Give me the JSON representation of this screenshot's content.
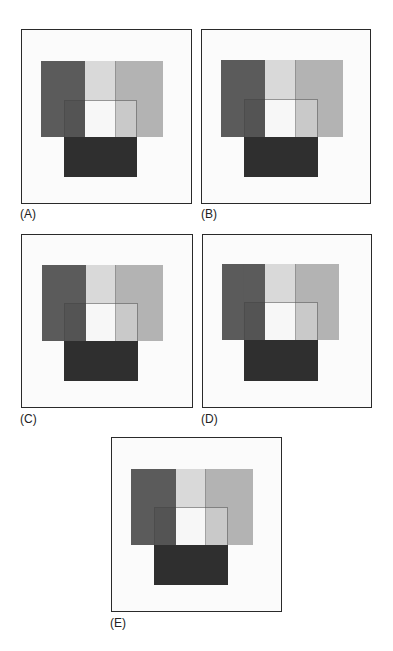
{
  "figure": {
    "colors": {
      "frame": "#2a2a2a",
      "frame_bg": "#fbfbfb",
      "dark_column": "#5b5b5b",
      "light_column": "#d9d9d9",
      "mid_column": "#b3b3b3",
      "inner_dark": "#545454",
      "inner_white": "#f7f7f7",
      "inner_right": "#c9c9c9",
      "bottom_block": "#2f2f2f"
    },
    "panels": [
      {
        "id": "A",
        "label": "(A)",
        "frame": {
          "x": 21,
          "y": 29,
          "w": 171,
          "h": 175
        },
        "label_pos": {
          "x": 20,
          "y": 208
        },
        "top": {
          "x": 41,
          "y": 61,
          "w": 122,
          "h": 76,
          "c1": 85,
          "c2": 115
        },
        "inner": {
          "x": 64,
          "y": 100,
          "w": 73,
          "h": 37
        },
        "bottom": {
          "x": 64,
          "y": 137,
          "w": 73,
          "h": 40
        },
        "extra_divider": null
      },
      {
        "id": "B",
        "label": "(B)",
        "frame": {
          "x": 201,
          "y": 29,
          "w": 170,
          "h": 175
        },
        "label_pos": {
          "x": 201,
          "y": 208
        },
        "top": {
          "x": 221,
          "y": 60,
          "w": 122,
          "h": 77,
          "c1": 265,
          "c2": 295
        },
        "inner": {
          "x": 244,
          "y": 99,
          "w": 74,
          "h": 38
        },
        "bottom": {
          "x": 244,
          "y": 137,
          "w": 74,
          "h": 40
        },
        "extra_divider": null
      },
      {
        "id": "C",
        "label": "(C)",
        "frame": {
          "x": 21,
          "y": 234,
          "w": 172,
          "h": 174
        },
        "label_pos": {
          "x": 20,
          "y": 413
        },
        "top": {
          "x": 42,
          "y": 265,
          "w": 121,
          "h": 76,
          "c1": 86,
          "c2": 115
        },
        "inner": {
          "x": 64,
          "y": 303,
          "w": 74,
          "h": 38
        },
        "bottom": {
          "x": 64,
          "y": 341,
          "w": 74,
          "h": 40
        },
        "extra_divider": null
      },
      {
        "id": "D",
        "label": "(D)",
        "frame": {
          "x": 202,
          "y": 234,
          "w": 170,
          "h": 174
        },
        "label_pos": {
          "x": 201,
          "y": 413
        },
        "top": {
          "x": 222,
          "y": 264,
          "w": 117,
          "h": 76,
          "c1": 265,
          "c2": 295
        },
        "inner": {
          "x": 244,
          "y": 302,
          "w": 74,
          "h": 38
        },
        "bottom": {
          "x": 244,
          "y": 340,
          "w": 74,
          "h": 41
        },
        "extra_divider": 243
      },
      {
        "id": "E",
        "label": "(E)",
        "frame": {
          "x": 111,
          "y": 437,
          "w": 171,
          "h": 175
        },
        "label_pos": {
          "x": 110,
          "y": 617
        },
        "top": {
          "x": 131,
          "y": 469,
          "w": 122,
          "h": 76,
          "c1": 176,
          "c2": 205
        },
        "inner": {
          "x": 154,
          "y": 507,
          "w": 74,
          "h": 38
        },
        "bottom": {
          "x": 154,
          "y": 545,
          "w": 74,
          "h": 40
        },
        "extra_divider": null
      }
    ]
  }
}
